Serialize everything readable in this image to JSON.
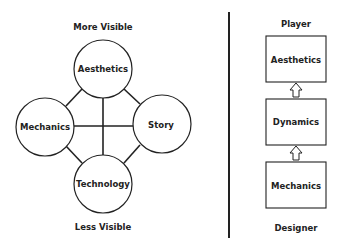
{
  "left_diagram": {
    "top_label": "More Visible",
    "bottom_label": "Less Visible",
    "nodes": {
      "top": "Aesthetics",
      "left": "Mechanics",
      "right": "Story",
      "bottom": "Technology"
    }
  },
  "right_diagram": {
    "top_label": "Player",
    "bottom_label": "Designer",
    "boxes": [
      "Aesthetics",
      "Dynamics",
      "Mechanics"
    ],
    "arrow_direction": "up"
  },
  "colors": {
    "stroke": "#222222",
    "background": "#ffffff"
  }
}
